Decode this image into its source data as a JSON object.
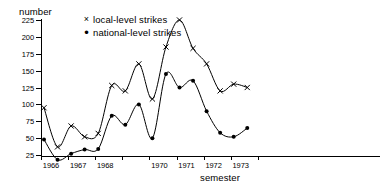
{
  "chart_data": {
    "type": "line",
    "title": "",
    "ylabel": "number",
    "xlabel": "semester",
    "ylim": [
      0,
      225
    ],
    "yticks": [
      25,
      50,
      75,
      100,
      125,
      150,
      175,
      200,
      225
    ],
    "xticklabels": [
      "1966",
      "1967",
      "1968",
      "",
      "1970",
      "1971",
      "1972",
      "1973"
    ],
    "xtick_years": [
      1966,
      1967,
      1968,
      1969,
      1970,
      1971,
      1972,
      1973
    ],
    "grid": false,
    "legend_position": "top-left-inside",
    "x_unit": "semester",
    "x": [
      "1966-1",
      "1966-2",
      "1967-1",
      "1967-2",
      "1968-1",
      "1968-2",
      "1969-1",
      "1969-2",
      "1970-1",
      "1970-2",
      "1971-1",
      "1971-2",
      "1972-1",
      "1972-2",
      "1973-1",
      "1973-2"
    ],
    "series": [
      {
        "name": "local-level strikes",
        "marker": "x",
        "values": [
          95,
          37,
          68,
          52,
          57,
          128,
          120,
          160,
          108,
          185,
          225,
          183,
          160,
          120,
          130,
          125
        ]
      },
      {
        "name": "national-level strikes",
        "marker": "dot",
        "values": [
          48,
          18,
          27,
          33,
          34,
          83,
          70,
          100,
          50,
          145,
          125,
          135,
          90,
          58,
          52,
          65
        ]
      }
    ]
  },
  "legend": {
    "items": [
      {
        "marker": "×",
        "label": "local-level strikes"
      },
      {
        "marker": "•",
        "label": "national-level strikes"
      }
    ]
  }
}
